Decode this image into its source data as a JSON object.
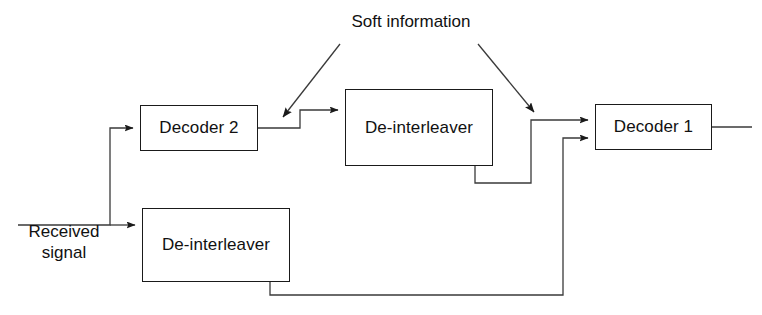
{
  "diagram": {
    "background_color": "#ffffff",
    "line_color": "#333333",
    "text_color": "#111111",
    "nodes": [
      {
        "id": "decoder2",
        "label": "Decoder 2"
      },
      {
        "id": "deint_top",
        "label": "De-interleaver"
      },
      {
        "id": "decoder1",
        "label": "Decoder 1"
      },
      {
        "id": "deint_bot",
        "label": "De-interleaver"
      }
    ],
    "labels": {
      "received_signal": "Received\nsignal",
      "received_signal_line1": "Received",
      "received_signal_line2": "signal",
      "soft_information": "Soft information"
    },
    "connections": [
      {
        "from": "received-signal-input",
        "to": "decoder2",
        "style": "orthogonal",
        "arrow": true
      },
      {
        "from": "received-signal-input",
        "to": "deint_bot",
        "style": "orthogonal",
        "arrow": true
      },
      {
        "from": "decoder2",
        "to": "deint_top",
        "style": "orthogonal-step-up",
        "arrow": true
      },
      {
        "from": "deint_top",
        "to": "decoder1",
        "style": "orthogonal",
        "arrow": true
      },
      {
        "from": "deint_bot",
        "to": "decoder1",
        "style": "orthogonal-feedback",
        "arrow": true
      },
      {
        "from": "decoder1",
        "to": "output",
        "style": "straight",
        "arrow": false
      },
      {
        "from": "soft_information",
        "to": "decoder2-output-link",
        "style": "annotation-arrow",
        "arrow": true
      },
      {
        "from": "soft_information",
        "to": "deint_top-output-link",
        "style": "annotation-arrow",
        "arrow": true
      }
    ]
  }
}
